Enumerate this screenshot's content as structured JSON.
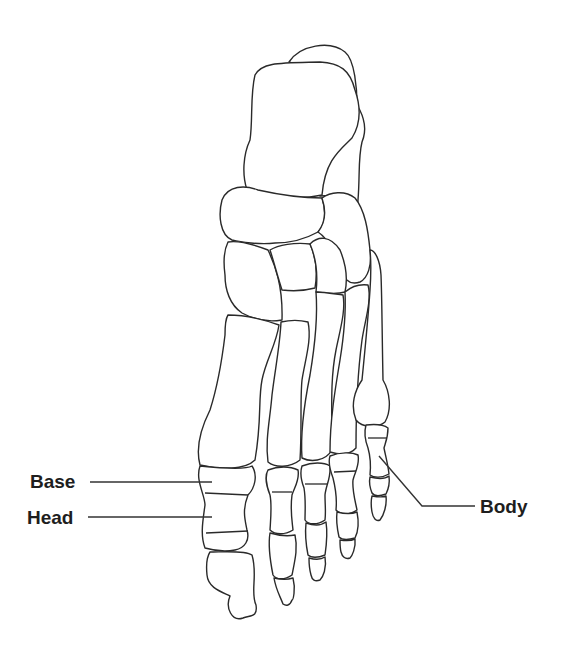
{
  "diagram": {
    "line_color": "#2a2a2a",
    "background": "#ffffff",
    "labels": [
      {
        "id": "base",
        "text": "Base",
        "x": 30,
        "y": 472,
        "target": "base of first proximal phalanx"
      },
      {
        "id": "head",
        "text": "Head",
        "x": 27,
        "y": 509,
        "target": "head of first proximal phalanx"
      },
      {
        "id": "body",
        "text": "Body",
        "x": 480,
        "y": 497,
        "target": "body of fifth proximal phalanx"
      }
    ]
  }
}
